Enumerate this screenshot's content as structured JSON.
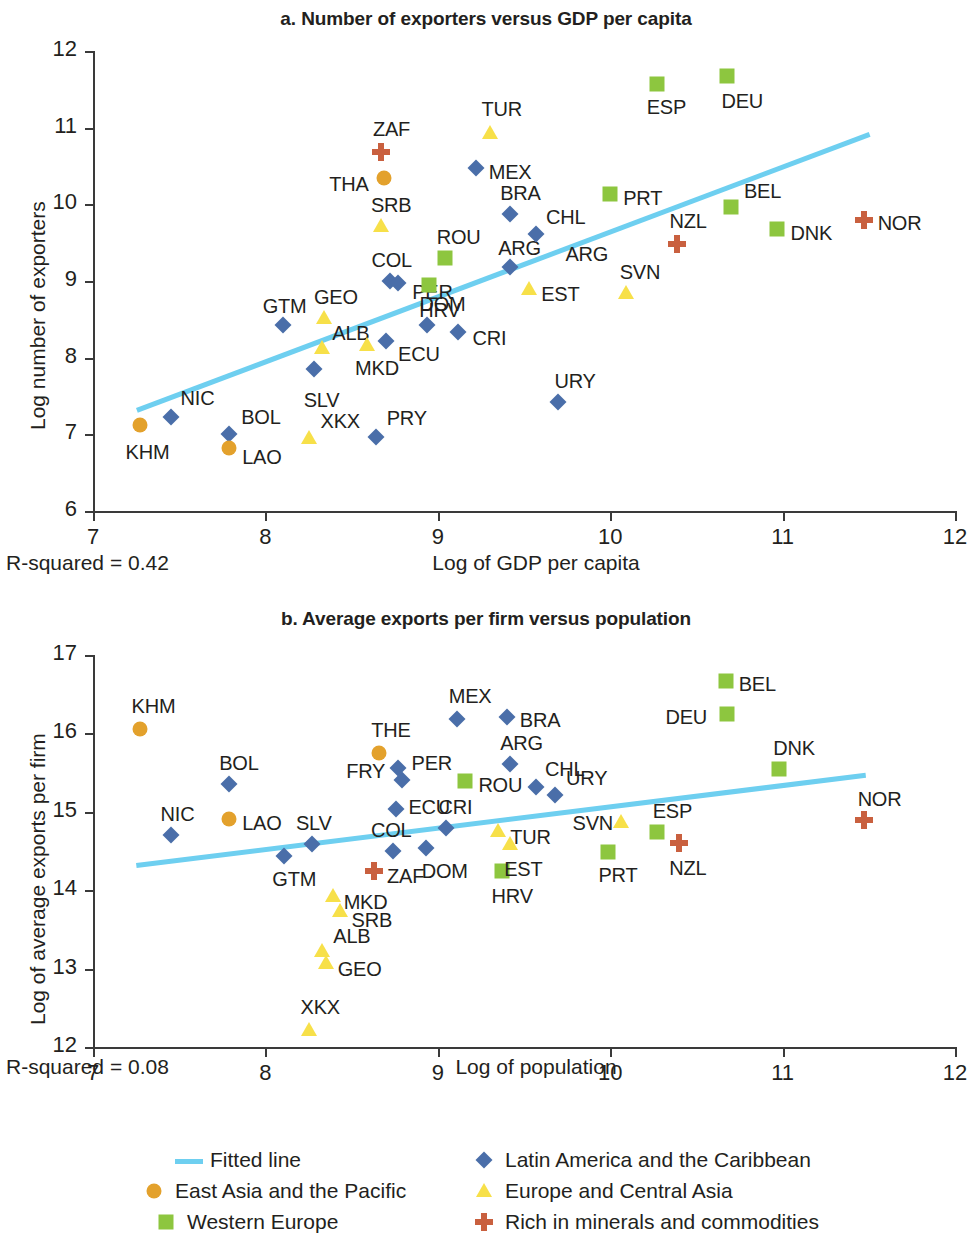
{
  "chart_data": [
    {
      "type": "scatter",
      "panel": "a",
      "title": "a. Number of exporters versus GDP per capita",
      "xlabel": "Log of GDP per capita",
      "ylabel": "Log number of exporters",
      "xlim": [
        7,
        12
      ],
      "ylim": [
        6,
        12
      ],
      "xticks": [
        "7",
        "8",
        "9",
        "10",
        "11",
        "12"
      ],
      "yticks": [
        "12",
        "11",
        "10",
        "9",
        "8",
        "7",
        "6"
      ],
      "grid": false,
      "annotation": "R-squared = 0.42",
      "fitted_line": {
        "x0": 7.25,
        "y0": 7.35,
        "x1": 11.5,
        "y1": 10.95
      },
      "points": [
        {
          "label": "KHM",
          "x": 7.27,
          "y": 7.12,
          "group": "East Asia and the Pacific",
          "lx": -14,
          "ly": 26
        },
        {
          "label": "NIC",
          "x": 7.45,
          "y": 7.22,
          "group": "Latin America and the Caribbean",
          "lx": 10,
          "ly": -20
        },
        {
          "label": "BOL",
          "x": 7.79,
          "y": 7.0,
          "group": "Latin America and the Caribbean",
          "lx": 12,
          "ly": -18
        },
        {
          "label": "LAO",
          "x": 7.79,
          "y": 6.82,
          "group": "East Asia and the Pacific",
          "lx": 13,
          "ly": 8
        },
        {
          "label": "XKX",
          "x": 8.25,
          "y": 6.95,
          "group": "Europe and Central Asia",
          "lx": 12,
          "ly": -18
        },
        {
          "label": "PRY",
          "x": 8.64,
          "y": 6.96,
          "group": "Latin America and the Caribbean",
          "lx": 11,
          "ly": -20
        },
        {
          "label": "SLV",
          "x": 8.28,
          "y": 7.85,
          "group": "Latin America and the Caribbean",
          "lx": -10,
          "ly": 30
        },
        {
          "label": "GTM",
          "x": 8.1,
          "y": 8.43,
          "group": "Latin America and the Caribbean",
          "lx": -20,
          "ly": -20
        },
        {
          "label": "GEO",
          "x": 8.34,
          "y": 8.52,
          "group": "Europe and Central Asia",
          "lx": -10,
          "ly": -22
        },
        {
          "label": "ALB",
          "x": 8.33,
          "y": 8.13,
          "group": "Europe and Central Asia",
          "lx": 10,
          "ly": -16
        },
        {
          "label": "MKD",
          "x": 8.59,
          "y": 8.16,
          "group": "Europe and Central Asia",
          "lx": -12,
          "ly": 22
        },
        {
          "label": "ECU",
          "x": 8.7,
          "y": 8.22,
          "group": "Latin America and the Caribbean",
          "lx": 12,
          "ly": 12
        },
        {
          "label": "DOM",
          "x": 8.94,
          "y": 8.42,
          "group": "Latin America and the Caribbean",
          "lx": -8,
          "ly": -22
        },
        {
          "label": "CRI",
          "x": 9.12,
          "y": 8.33,
          "group": "Latin America and the Caribbean",
          "lx": 14,
          "ly": 5
        },
        {
          "label": "COL",
          "x": 8.72,
          "y": 9.0,
          "group": "Latin America and the Caribbean",
          "lx": -18,
          "ly": -22
        },
        {
          "label": "PER",
          "x": 8.77,
          "y": 8.97,
          "group": "Latin America and the Caribbean",
          "lx": 14,
          "ly": 8
        },
        {
          "label": "SRB",
          "x": 8.67,
          "y": 9.72,
          "group": "Europe and Central Asia",
          "lx": -10,
          "ly": -22
        },
        {
          "label": "THA",
          "x": 8.69,
          "y": 10.35,
          "group": "East Asia and the Pacific",
          "lx": -55,
          "ly": 5
        },
        {
          "label": "ZAF",
          "x": 8.67,
          "y": 10.68,
          "group": "Rich in minerals and commodities",
          "lx": -8,
          "ly": -24
        },
        {
          "label": "ROU",
          "x": 9.04,
          "y": 9.3,
          "group": "Western Europe",
          "lx": -8,
          "ly": -22
        },
        {
          "label": "HRV",
          "x": 8.95,
          "y": 8.95,
          "group": "Western Europe",
          "lx": -10,
          "ly": 24
        },
        {
          "label": "ARG",
          "x": 9.42,
          "y": 9.18,
          "group": "Latin America and the Caribbean",
          "lx": -12,
          "ly": -20
        },
        {
          "label": "ARG",
          "x": 9.74,
          "y": 9.36,
          "group": "label-only",
          "lx": 0,
          "ly": 0
        },
        {
          "label": "BRA",
          "x": 9.42,
          "y": 9.87,
          "group": "Latin America and the Caribbean",
          "lx": -10,
          "ly": -22
        },
        {
          "label": "CHL",
          "x": 9.57,
          "y": 9.61,
          "group": "Latin America and the Caribbean",
          "lx": 10,
          "ly": -18
        },
        {
          "label": "MEX",
          "x": 9.22,
          "y": 10.47,
          "group": "Latin America and the Caribbean",
          "lx": 13,
          "ly": 3
        },
        {
          "label": "TUR",
          "x": 9.3,
          "y": 10.93,
          "group": "Europe and Central Asia",
          "lx": -8,
          "ly": -25
        },
        {
          "label": "EST",
          "x": 9.53,
          "y": 8.9,
          "group": "Europe and Central Asia",
          "lx": 12,
          "ly": 4
        },
        {
          "label": "SVN",
          "x": 10.09,
          "y": 8.85,
          "group": "Europe and Central Asia",
          "lx": -6,
          "ly": -22
        },
        {
          "label": "URY",
          "x": 9.7,
          "y": 7.42,
          "group": "Latin America and the Caribbean",
          "lx": -4,
          "ly": -22
        },
        {
          "label": "PRT",
          "x": 10.0,
          "y": 10.14,
          "group": "Western Europe",
          "lx": 13,
          "ly": 3
        },
        {
          "label": "NZL",
          "x": 10.39,
          "y": 9.48,
          "group": "Rich in minerals and commodities",
          "lx": -8,
          "ly": -24
        },
        {
          "label": "ESP",
          "x": 10.27,
          "y": 11.57,
          "group": "Western Europe",
          "lx": -10,
          "ly": 22
        },
        {
          "label": "DEU",
          "x": 10.68,
          "y": 11.68,
          "group": "Western Europe",
          "lx": -6,
          "ly": 24
        },
        {
          "label": "BEL",
          "x": 10.7,
          "y": 9.97,
          "group": "Western Europe",
          "lx": 13,
          "ly": -17
        },
        {
          "label": "DNK",
          "x": 10.97,
          "y": 9.68,
          "group": "Western Europe",
          "lx": 13,
          "ly": 3
        },
        {
          "label": "NOR",
          "x": 11.47,
          "y": 9.8,
          "group": "Rich in minerals and commodities",
          "lx": 14,
          "ly": 2
        }
      ]
    },
    {
      "type": "scatter",
      "panel": "b",
      "title": "b. Average exports per firm versus population",
      "xlabel": "Log of population",
      "ylabel": "Log of average exports per firm",
      "xlim": [
        7,
        12
      ],
      "ylim": [
        12,
        17
      ],
      "xticks": [
        "7",
        "8",
        "9",
        "10",
        "11",
        "12"
      ],
      "yticks": [
        "17",
        "16",
        "15",
        "14",
        "13",
        "12"
      ],
      "grid": false,
      "annotation": "R-squared = 0.08",
      "fitted_line": {
        "x0": 7.25,
        "y0": 14.35,
        "x1": 11.48,
        "y1": 15.5
      },
      "points": [
        {
          "label": "KHM",
          "x": 7.27,
          "y": 16.06,
          "group": "East Asia and the Pacific",
          "lx": -8,
          "ly": -24
        },
        {
          "label": "NIC",
          "x": 7.45,
          "y": 14.71,
          "group": "Latin America and the Caribbean",
          "lx": -10,
          "ly": -22
        },
        {
          "label": "BOL",
          "x": 7.79,
          "y": 15.35,
          "group": "Latin America and the Caribbean",
          "lx": -10,
          "ly": -22
        },
        {
          "label": "LAO",
          "x": 7.79,
          "y": 14.91,
          "group": "East Asia and the Pacific",
          "lx": 13,
          "ly": 3
        },
        {
          "label": "GTM",
          "x": 8.11,
          "y": 14.44,
          "group": "Latin America and the Caribbean",
          "lx": -12,
          "ly": 22
        },
        {
          "label": "SLV",
          "x": 8.27,
          "y": 14.59,
          "group": "Latin America and the Caribbean",
          "lx": -16,
          "ly": -22
        },
        {
          "label": "XKX",
          "x": 8.25,
          "y": 12.22,
          "group": "Europe and Central Asia",
          "lx": -8,
          "ly": -24
        },
        {
          "label": "ALB",
          "x": 8.33,
          "y": 13.22,
          "group": "Europe and Central Asia",
          "lx": 11,
          "ly": -16
        },
        {
          "label": "GEO",
          "x": 8.35,
          "y": 13.07,
          "group": "Europe and Central Asia",
          "lx": 12,
          "ly": 5
        },
        {
          "label": "MKD",
          "x": 8.39,
          "y": 13.92,
          "group": "Europe and Central Asia",
          "lx": 11,
          "ly": 5
        },
        {
          "label": "SRB",
          "x": 8.43,
          "y": 13.73,
          "group": "Europe and Central Asia",
          "lx": 12,
          "ly": 8
        },
        {
          "label": "ZAF",
          "x": 8.63,
          "y": 14.25,
          "group": "Rich in minerals and commodities",
          "lx": 13,
          "ly": 4
        },
        {
          "label": "COL",
          "x": 8.74,
          "y": 14.5,
          "group": "Latin America and the Caribbean",
          "lx": -22,
          "ly": -22
        },
        {
          "label": "THE",
          "x": 8.66,
          "y": 15.75,
          "group": "East Asia and the Pacific",
          "lx": -8,
          "ly": -24
        },
        {
          "label": "FRY",
          "x": 8.77,
          "y": 15.56,
          "group": "Latin America and the Caribbean",
          "lx": -52,
          "ly": 2
        },
        {
          "label": "PER",
          "x": 8.79,
          "y": 15.41,
          "group": "Latin America and the Caribbean",
          "lx": 10,
          "ly": -18
        },
        {
          "label": "ECU",
          "x": 8.76,
          "y": 15.03,
          "group": "Latin America and the Caribbean",
          "lx": 12,
          "ly": -3
        },
        {
          "label": "DOM",
          "x": 8.93,
          "y": 14.54,
          "group": "Latin America and the Caribbean",
          "lx": -4,
          "ly": 22
        },
        {
          "label": "CRI",
          "x": 9.05,
          "y": 14.79,
          "group": "Latin America and the Caribbean",
          "lx": -8,
          "ly": -22
        },
        {
          "label": "MEX",
          "x": 9.11,
          "y": 16.18,
          "group": "Latin America and the Caribbean",
          "lx": -8,
          "ly": -24
        },
        {
          "label": "ROU",
          "x": 9.16,
          "y": 15.39,
          "group": "Western Europe",
          "lx": 13,
          "ly": 3
        },
        {
          "label": "TUR",
          "x": 9.35,
          "y": 14.76,
          "group": "Europe and Central Asia",
          "lx": 12,
          "ly": 5
        },
        {
          "label": "HRV",
          "x": 9.37,
          "y": 14.25,
          "group": "Western Europe",
          "lx": -10,
          "ly": 24
        },
        {
          "label": "EST",
          "x": 9.42,
          "y": 14.59,
          "group": "Europe and Central Asia",
          "lx": -6,
          "ly": 24
        },
        {
          "label": "ARG",
          "x": 9.42,
          "y": 15.61,
          "group": "Latin America and the Caribbean",
          "lx": -10,
          "ly": -22
        },
        {
          "label": "BRA",
          "x": 9.4,
          "y": 16.21,
          "group": "Latin America and the Caribbean",
          "lx": 13,
          "ly": 2
        },
        {
          "label": "CHL",
          "x": 9.57,
          "y": 15.32,
          "group": "Latin America and the Caribbean",
          "lx": 9,
          "ly": -19
        },
        {
          "label": "URY",
          "x": 9.68,
          "y": 15.21,
          "group": "Latin America and the Caribbean",
          "lx": 11,
          "ly": -18
        },
        {
          "label": "SVN",
          "x": 10.06,
          "y": 14.87,
          "group": "Europe and Central Asia",
          "lx": -48,
          "ly": 0
        },
        {
          "label": "PRT",
          "x": 9.99,
          "y": 14.49,
          "group": "Western Europe",
          "lx": -10,
          "ly": 22
        },
        {
          "label": "ESP",
          "x": 10.27,
          "y": 14.74,
          "group": "Western Europe",
          "lx": -4,
          "ly": -22
        },
        {
          "label": "NZL",
          "x": 10.4,
          "y": 14.6,
          "group": "Rich in minerals and commodities",
          "lx": -10,
          "ly": 24
        },
        {
          "label": "DEU",
          "x": 10.68,
          "y": 16.25,
          "group": "Western Europe",
          "lx": -62,
          "ly": 2
        },
        {
          "label": "BEL",
          "x": 10.67,
          "y": 16.67,
          "group": "Western Europe",
          "lx": 13,
          "ly": 2
        },
        {
          "label": "DNK",
          "x": 10.98,
          "y": 15.54,
          "group": "Western Europe",
          "lx": -6,
          "ly": -22
        },
        {
          "label": "NOR",
          "x": 11.47,
          "y": 14.9,
          "group": "Rich in minerals and commodities",
          "lx": -6,
          "ly": -22
        }
      ]
    }
  ],
  "legend": {
    "items": [
      {
        "label": "Fitted line",
        "marker": "line",
        "color": "#6ecff0"
      },
      {
        "label": "Latin America and the Caribbean",
        "marker": "diamond",
        "color": "#4a6ea9"
      },
      {
        "label": "East Asia and the Pacific",
        "marker": "circle",
        "color": "#e3a12c"
      },
      {
        "label": "Europe and Central Asia",
        "marker": "triangle",
        "color": "#f7e049"
      },
      {
        "label": "Western Europe",
        "marker": "square",
        "color": "#8dc63f"
      },
      {
        "label": "Rich in minerals and commodities",
        "marker": "plus",
        "color": "#c9603f"
      }
    ]
  }
}
